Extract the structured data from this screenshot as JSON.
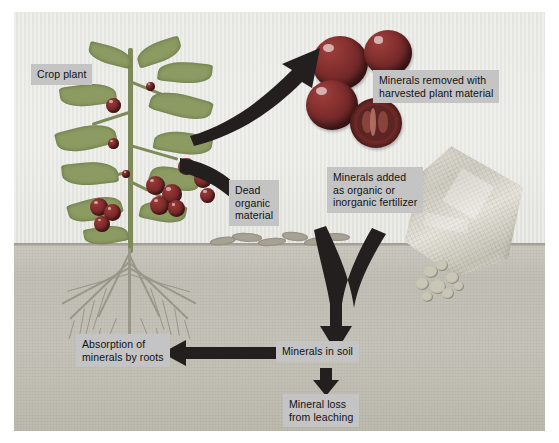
{
  "figure": {
    "type": "diagram",
    "background_color": "#e9e9e6",
    "label_box_color": "#c4c4c4",
    "arrow_color": "#231f1e",
    "soil_color": "#c3c0b6"
  },
  "labels": {
    "crop_plant": "Crop plant",
    "minerals_removed": "Minerals removed with\nharvested plant material",
    "dead_organic": "Dead\norganic\nmaterial",
    "minerals_added": "Minerals added\nas organic or\ninorganic fertilizer",
    "absorption": "Absorption of\nminerals by roots",
    "minerals_in_soil": "Minerals in soil",
    "mineral_loss": "Mineral loss\nfrom leaching"
  },
  "flows": [
    {
      "id": "plant-to-harvest",
      "from": "Crop plant",
      "to": "Minerals removed with harvested plant material",
      "style": "curved-arrow",
      "direction": "up-right"
    },
    {
      "id": "plant-to-litter",
      "from": "Crop plant",
      "to": "Dead organic material",
      "style": "curved-arrow",
      "direction": "down-right"
    },
    {
      "id": "litter-and-fertilizer-to-soil",
      "from": "Dead organic material and fertilizer",
      "to": "Minerals in soil",
      "style": "merging-v-arrow",
      "direction": "down"
    },
    {
      "id": "soil-to-roots",
      "from": "Minerals in soil",
      "to": "Absorption of minerals by roots",
      "style": "straight-arrow",
      "direction": "left"
    },
    {
      "id": "soil-to-leaching",
      "from": "Minerals in soil",
      "to": "Mineral loss from leaching",
      "style": "straight-arrow",
      "direction": "down"
    }
  ],
  "illustration_elements": {
    "plant": "tomato-crop-plant",
    "roots": "fibrous-root-system",
    "harvest": "harvested-tomatoes",
    "cut_tomato": "tomato-cross-section",
    "fertilizer_bag": "tilted-fertilizer-bag-pouring",
    "granules": "fertilizer-granule-pile",
    "litter": "dead-plant-litter-on-soil",
    "soil": "soil-profile"
  }
}
